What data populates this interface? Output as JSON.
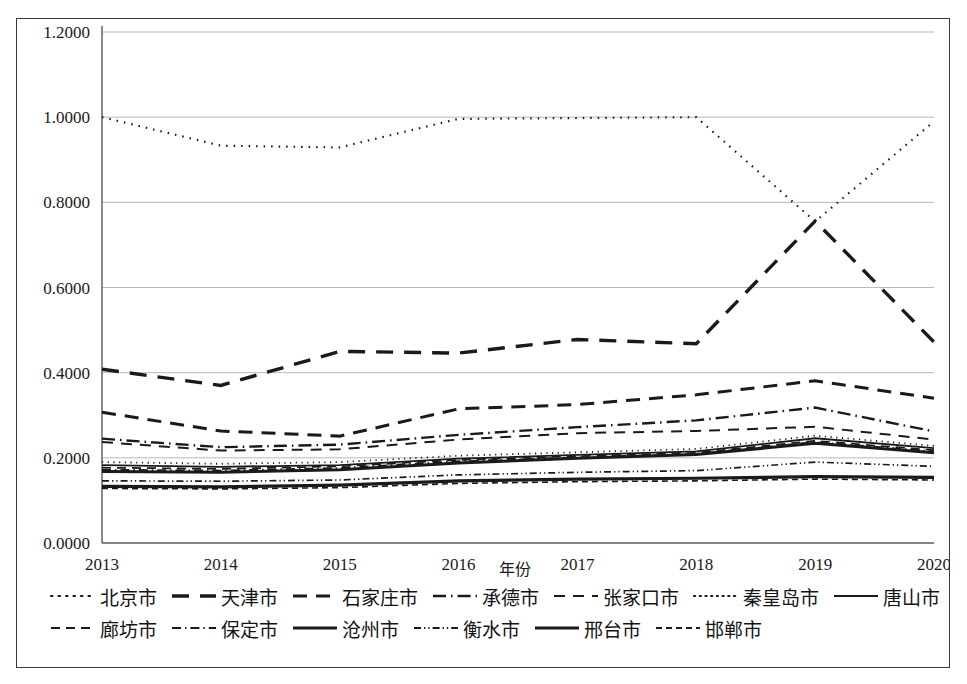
{
  "chart_data": {
    "type": "line",
    "title": "",
    "xlabel": "年份",
    "ylabel": "",
    "x": [
      2013,
      2014,
      2015,
      2016,
      2017,
      2018,
      2019,
      2020
    ],
    "xtick_labels": [
      "2013",
      "2014",
      "2015",
      "2016",
      "2017",
      "2018",
      "2019",
      "2020"
    ],
    "ytick_labels": [
      "0.0000",
      "0.2000",
      "0.4000",
      "0.6000",
      "0.8000",
      "1.0000",
      "1.2000"
    ],
    "ytick_values": [
      0.0,
      0.2,
      0.4,
      0.6,
      0.8,
      1.0,
      1.2
    ],
    "ylim": [
      0.0,
      1.2
    ],
    "grid": true,
    "legend_position": "bottom",
    "line_color": "#1a1a1a",
    "series": [
      {
        "name": "北京市",
        "dash": "dotted",
        "width": 2.2,
        "values": [
          1.0,
          0.933,
          0.929,
          0.996,
          0.998,
          1.0,
          0.755,
          0.99
        ]
      },
      {
        "name": "天津市",
        "dash": "dashed-lg",
        "width": 3.4,
        "values": [
          0.408,
          0.37,
          0.45,
          0.446,
          0.478,
          0.468,
          0.756,
          0.472
        ]
      },
      {
        "name": "石家庄市",
        "dash": "dashed-md",
        "width": 3.0,
        "values": [
          0.307,
          0.263,
          0.251,
          0.315,
          0.325,
          0.348,
          0.381,
          0.34
        ]
      },
      {
        "name": "承德市",
        "dash": "dash-dot",
        "width": 2.4,
        "values": [
          0.245,
          0.225,
          0.231,
          0.254,
          0.272,
          0.288,
          0.318,
          0.262
        ]
      },
      {
        "name": "张家口市",
        "dash": "dashed-sm",
        "width": 2.0,
        "values": [
          0.237,
          0.217,
          0.22,
          0.243,
          0.258,
          0.263,
          0.273,
          0.243
        ]
      },
      {
        "name": "秦皇岛市",
        "dash": "dotted-fine",
        "width": 1.8,
        "values": [
          0.19,
          0.186,
          0.19,
          0.205,
          0.213,
          0.221,
          0.252,
          0.228
        ]
      },
      {
        "name": "唐山市",
        "dash": "solid-thin",
        "width": 1.8,
        "values": [
          0.183,
          0.179,
          0.183,
          0.198,
          0.207,
          0.215,
          0.246,
          0.223
        ]
      },
      {
        "name": "廊坊市",
        "dash": "dashed-xs",
        "width": 1.7,
        "values": [
          0.177,
          0.174,
          0.18,
          0.195,
          0.204,
          0.212,
          0.24,
          0.218
        ]
      },
      {
        "name": "保定市",
        "dash": "dash-dot-sm",
        "width": 1.9,
        "values": [
          0.172,
          0.17,
          0.176,
          0.192,
          0.201,
          0.209,
          0.237,
          0.215
        ]
      },
      {
        "name": "沧州市",
        "dash": "solid-thick",
        "width": 3.0,
        "values": [
          0.168,
          0.166,
          0.172,
          0.188,
          0.199,
          0.208,
          0.234,
          0.212
        ]
      },
      {
        "name": "衡水市",
        "dash": "dash-dot-dot",
        "width": 1.7,
        "values": [
          0.146,
          0.145,
          0.148,
          0.16,
          0.166,
          0.17,
          0.19,
          0.18
        ]
      },
      {
        "name": "邢台市",
        "dash": "solid-heavy",
        "width": 3.2,
        "values": [
          0.133,
          0.132,
          0.136,
          0.146,
          0.15,
          0.152,
          0.156,
          0.154
        ]
      },
      {
        "name": "邯郸市",
        "dash": "dashed-dot4",
        "width": 1.6,
        "values": [
          0.128,
          0.127,
          0.13,
          0.14,
          0.144,
          0.146,
          0.15,
          0.148
        ]
      }
    ]
  },
  "legend": {
    "row1": [
      "北京市",
      "天津市",
      "石家庄市",
      "承德市",
      "张家口市",
      "秦皇岛市",
      "唐山市"
    ],
    "row2": [
      "廊坊市",
      "保定市",
      "沧州市",
      "衡水市",
      "邢台市",
      "邯郸市"
    ]
  }
}
